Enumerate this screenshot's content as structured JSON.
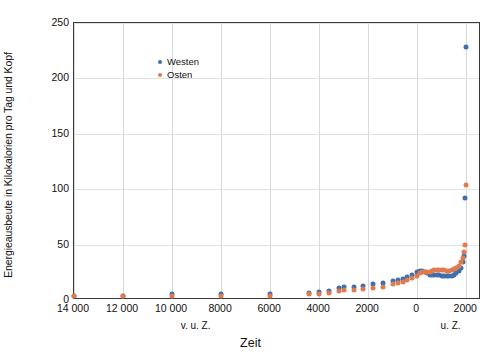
{
  "chart_data": {
    "type": "scatter",
    "title": "",
    "xlabel": "Zeit",
    "ylabel": "Energieausbeute in Kilokalorien pro Tag und Kopf",
    "xlim": [
      -14000,
      2600
    ],
    "ylim": [
      0,
      250
    ],
    "grid": true,
    "legend_position": "top-left",
    "xticks": [
      {
        "value": -14000,
        "label": "14 000"
      },
      {
        "value": -12000,
        "label": "12 000"
      },
      {
        "value": -10000,
        "label": "10 000"
      },
      {
        "value": -8000,
        "label": "8000"
      },
      {
        "value": -6000,
        "label": "6000"
      },
      {
        "value": -4000,
        "label": "4000"
      },
      {
        "value": -2000,
        "label": "2000"
      },
      {
        "value": 0,
        "label": "0"
      },
      {
        "value": 2000,
        "label": "2000"
      }
    ],
    "yticks": [
      {
        "value": 0,
        "label": "0"
      },
      {
        "value": 50,
        "label": "50"
      },
      {
        "value": 100,
        "label": "100"
      },
      {
        "value": 150,
        "label": "150"
      },
      {
        "value": 200,
        "label": "200"
      },
      {
        "value": 250,
        "label": "250"
      }
    ],
    "era_labels": [
      {
        "value": -9000,
        "label": "v. u. Z."
      },
      {
        "value": 1400,
        "label": "u. Z."
      }
    ],
    "series": [
      {
        "name": "Westen",
        "color": "#3f6fad",
        "points": [
          [
            -14000,
            4
          ],
          [
            -12000,
            4
          ],
          [
            -10000,
            5
          ],
          [
            -8000,
            5
          ],
          [
            -6000,
            5
          ],
          [
            -4400,
            6
          ],
          [
            -4000,
            7
          ],
          [
            -3600,
            8
          ],
          [
            -3200,
            11
          ],
          [
            -3000,
            12
          ],
          [
            -2600,
            12
          ],
          [
            -2200,
            13
          ],
          [
            -1800,
            14
          ],
          [
            -1400,
            15
          ],
          [
            -1000,
            17
          ],
          [
            -800,
            18
          ],
          [
            -600,
            19
          ],
          [
            -400,
            21
          ],
          [
            -200,
            23
          ],
          [
            0,
            25
          ],
          [
            100,
            26
          ],
          [
            200,
            26
          ],
          [
            300,
            25
          ],
          [
            400,
            24
          ],
          [
            500,
            23
          ],
          [
            600,
            23
          ],
          [
            700,
            23
          ],
          [
            800,
            23
          ],
          [
            900,
            23
          ],
          [
            1000,
            22
          ],
          [
            1100,
            22
          ],
          [
            1200,
            22
          ],
          [
            1300,
            22
          ],
          [
            1400,
            22
          ],
          [
            1500,
            23
          ],
          [
            1600,
            24
          ],
          [
            1700,
            26
          ],
          [
            1800,
            29
          ],
          [
            1850,
            34
          ],
          [
            1900,
            40
          ],
          [
            1950,
            92
          ],
          [
            2000,
            228
          ]
        ]
      },
      {
        "name": "Osten",
        "color": "#e07a4f",
        "points": [
          [
            -14000,
            4
          ],
          [
            -12000,
            4
          ],
          [
            -10000,
            4
          ],
          [
            -8000,
            4
          ],
          [
            -6000,
            4
          ],
          [
            -4400,
            5
          ],
          [
            -4000,
            5
          ],
          [
            -3600,
            6
          ],
          [
            -3200,
            8
          ],
          [
            -3000,
            9
          ],
          [
            -2600,
            9
          ],
          [
            -2200,
            10
          ],
          [
            -1800,
            11
          ],
          [
            -1400,
            12
          ],
          [
            -1000,
            14
          ],
          [
            -800,
            15
          ],
          [
            -600,
            16
          ],
          [
            -400,
            18
          ],
          [
            -200,
            20
          ],
          [
            0,
            22
          ],
          [
            100,
            24
          ],
          [
            200,
            25
          ],
          [
            300,
            25
          ],
          [
            400,
            25
          ],
          [
            500,
            25
          ],
          [
            600,
            26
          ],
          [
            700,
            27
          ],
          [
            800,
            27
          ],
          [
            900,
            27
          ],
          [
            1000,
            27
          ],
          [
            1100,
            27
          ],
          [
            1200,
            26
          ],
          [
            1300,
            26
          ],
          [
            1400,
            27
          ],
          [
            1500,
            28
          ],
          [
            1600,
            29
          ],
          [
            1700,
            31
          ],
          [
            1800,
            34
          ],
          [
            1850,
            38
          ],
          [
            1900,
            43
          ],
          [
            1950,
            50
          ],
          [
            2000,
            104
          ]
        ]
      }
    ]
  },
  "legend": {
    "items": [
      {
        "label": "Westen",
        "color": "#3f6fad"
      },
      {
        "label": "Osten",
        "color": "#e07a4f"
      }
    ]
  }
}
